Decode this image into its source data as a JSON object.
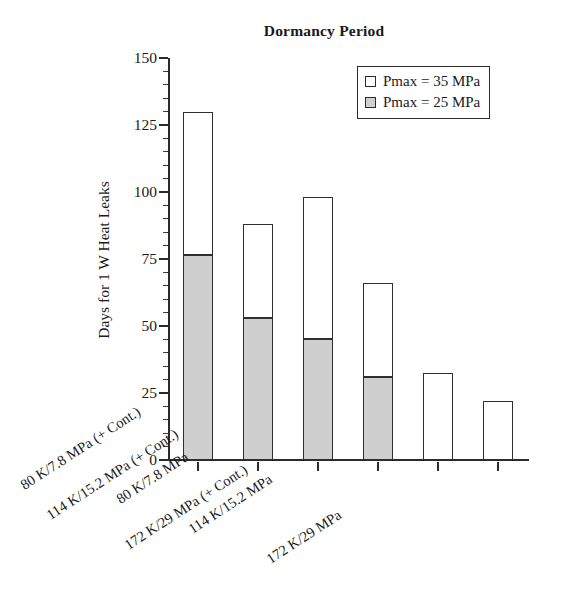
{
  "chart_data": {
    "type": "bar",
    "subtype": "stacked-bar",
    "title": "Dormancy Period",
    "xlabel": "",
    "ylabel": "Days for 1 W Heat Leaks",
    "ylim": [
      0,
      150
    ],
    "ytick_values": [
      0,
      25,
      50,
      75,
      100,
      125,
      150
    ],
    "ytick_labels": [
      "0",
      "25",
      "50",
      "75",
      "100",
      "125",
      "150"
    ],
    "minor_tick_step": 5,
    "grid": false,
    "legend_position": "top-right",
    "categories": [
      "80 K/7.8 MPa (+ Cont.)",
      "80 K/7.8 MPa",
      "114 K/15.2 MPa (+ Cont.)",
      "114 K/15.2 MPa",
      "172 K/29 MPa (+ Cont.)",
      "172 K/29 MPa"
    ],
    "series": [
      {
        "name": "Pmax = 25 MPa",
        "color": "#cfcfcf",
        "values": [
          76.5,
          53,
          45,
          31,
          0,
          0
        ]
      },
      {
        "name": "Pmax = 35 MPa",
        "color": "#ffffff",
        "values": [
          130,
          88,
          98,
          66,
          32.5,
          22
        ],
        "note": "bar total height (top of stack)"
      }
    ]
  },
  "legend": {
    "entries": [
      {
        "label": "Pmax = 35 MPa",
        "swatch": "white-square-icon"
      },
      {
        "label": "Pmax = 25 MPa",
        "swatch": "grey-square-icon"
      }
    ]
  }
}
